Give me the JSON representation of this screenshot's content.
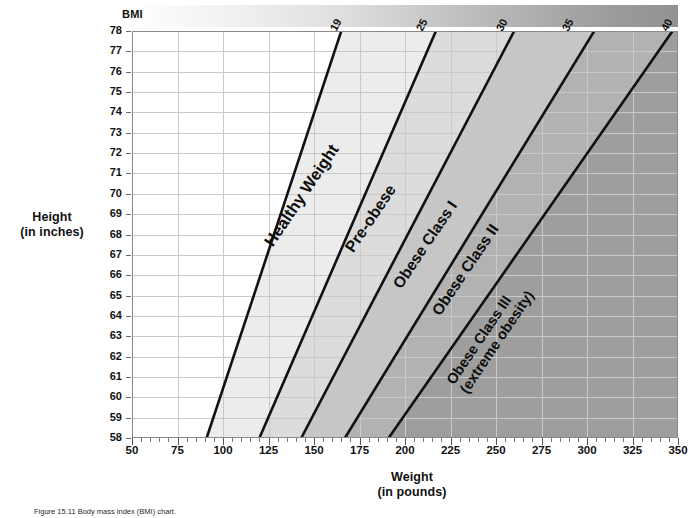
{
  "chart_data": {
    "type": "line",
    "xlabel": "Weight\n(in pounds)",
    "ylabel": "Height\n(in inches)",
    "xlim": [
      50,
      350
    ],
    "ylim": [
      58,
      78
    ],
    "grid": true,
    "legend_position": "top",
    "legend_title": "BMI",
    "x_ticks": [
      50,
      75,
      100,
      125,
      150,
      175,
      200,
      225,
      250,
      275,
      300,
      325,
      350
    ],
    "x_minor_tick_step": 5,
    "y_ticks": [
      58,
      59,
      60,
      61,
      62,
      63,
      64,
      65,
      66,
      67,
      68,
      69,
      70,
      71,
      72,
      73,
      74,
      75,
      76,
      77,
      78
    ],
    "bmi_legend_ticks": [
      "19",
      "25",
      "30",
      "35",
      "40"
    ],
    "series": [
      {
        "name": "BMI 19",
        "bmi": 19,
        "x_at_height_58": 91,
        "x_at_height_78": 165
      },
      {
        "name": "BMI 25",
        "bmi": 25,
        "x_at_height_58": 120,
        "x_at_height_78": 217
      },
      {
        "name": "BMI 30",
        "bmi": 30,
        "x_at_height_58": 143,
        "x_at_height_78": 260
      },
      {
        "name": "BMI 35",
        "bmi": 35,
        "x_at_height_58": 167,
        "x_at_height_78": 304
      },
      {
        "name": "BMI 40",
        "bmi": 40,
        "x_at_height_58": 191,
        "x_at_height_78": 347
      }
    ],
    "bands": [
      {
        "label": "Underweight",
        "bmi_range": [
          0,
          19
        ],
        "shown_label": ""
      },
      {
        "label": "Healthy Weight",
        "bmi_range": [
          19,
          25
        ],
        "shown_label": "Healthy Weight"
      },
      {
        "label": "Pre-obese",
        "bmi_range": [
          25,
          30
        ],
        "shown_label": "Pre-obese"
      },
      {
        "label": "Obese Class I",
        "bmi_range": [
          30,
          35
        ],
        "shown_label": "Obese Class I"
      },
      {
        "label": "Obese Class II",
        "bmi_range": [
          35,
          40
        ],
        "shown_label": "Obese Class II"
      },
      {
        "label": "Obese Class III (extreme obesity)",
        "bmi_range": [
          40,
          99
        ],
        "shown_label": "Obese Class III\n(extreme obesity)"
      }
    ]
  },
  "legend": {
    "title": "BMI",
    "ticks": [
      {
        "value": "19",
        "left_px": 206
      },
      {
        "value": "25",
        "left_px": 292
      },
      {
        "value": "30",
        "left_px": 372
      },
      {
        "value": "35",
        "left_px": 438
      },
      {
        "value": "40",
        "left_px": 537
      }
    ]
  },
  "axes": {
    "y_title_line1": "Height",
    "y_title_line2": "(in inches)",
    "x_title_line1": "Weight",
    "x_title_line2": "(in pounds)",
    "y_labels": [
      "78",
      "77",
      "76",
      "75",
      "74",
      "73",
      "72",
      "71",
      "70",
      "69",
      "68",
      "67",
      "66",
      "65",
      "64",
      "63",
      "62",
      "61",
      "60",
      "59",
      "58"
    ],
    "x_labels": [
      "50",
      "75",
      "100",
      "125",
      "150",
      "175",
      "200",
      "225",
      "250",
      "275",
      "300",
      "325",
      "350"
    ]
  },
  "band_labels": {
    "healthy": "Healthy Weight",
    "preobese": "Pre-obese",
    "class1": "Obese Class I",
    "class2": "Obese Class II",
    "class3_line1": "Obese Class III",
    "class3_line2": "(extreme obesity)"
  },
  "caption": {
    "figure_prefix": "Figure 15.11",
    "text": "Figure 15.11   Body mass index (BMI) chart."
  },
  "colors": {
    "ink": "#111111",
    "grid": "#c9c9c9",
    "axis": "#6d6d6d",
    "line": "#111111",
    "band_underweight": "#ffffff",
    "band_healthy": "#ececec",
    "band_preobese": "#dcdcdc",
    "band_class1": "#c6c6c6",
    "band_class2": "#b2b2b2",
    "band_class3": "#9e9e9e"
  }
}
